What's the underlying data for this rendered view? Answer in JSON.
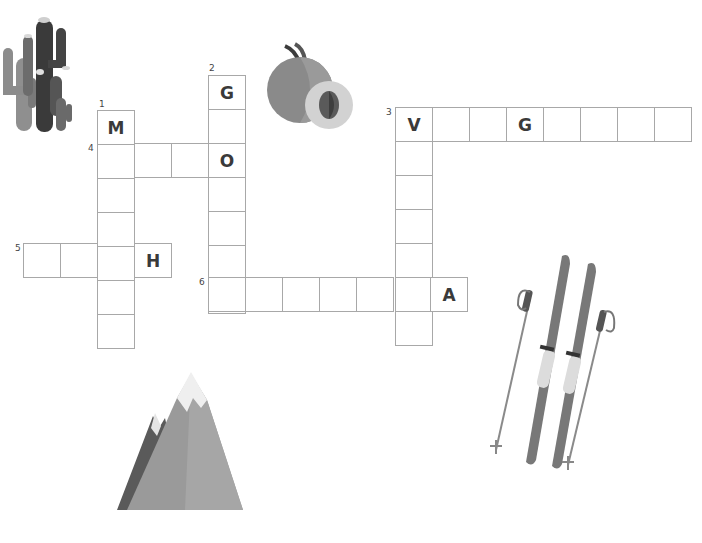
{
  "puzzle": {
    "type": "crossword",
    "cell_size": [
      37,
      34
    ],
    "words": [
      {
        "number": "1",
        "direction": "down",
        "x": 97,
        "y": 110,
        "length": 7,
        "letters": [
          "M",
          "",
          "",
          "",
          "",
          "",
          ""
        ]
      },
      {
        "number": "2",
        "direction": "down",
        "x": 208,
        "y": 75,
        "length": 7,
        "letters": [
          "G",
          "",
          "O",
          "",
          "",
          "",
          ""
        ]
      },
      {
        "number": "3",
        "direction": "across",
        "x": 395,
        "y": 107,
        "length": 8,
        "letters": [
          "V",
          "",
          "",
          "G",
          "",
          "",
          "",
          ""
        ]
      },
      {
        "number": "3",
        "direction": "down",
        "x": 395,
        "y": 107,
        "length": 7,
        "letters": [
          "V",
          "",
          "",
          "",
          "",
          "",
          ""
        ]
      },
      {
        "number": "4",
        "direction": "across",
        "x": 97,
        "y": 143,
        "length": 4,
        "letters": [
          "",
          "",
          "",
          "O"
        ]
      },
      {
        "number": "5",
        "direction": "across",
        "x": 23,
        "y": 243,
        "length": 4,
        "letters": [
          "",
          "",
          "",
          "H"
        ]
      },
      {
        "number": "6",
        "direction": "across",
        "x": 208,
        "y": 277,
        "length": 7,
        "letters": [
          "",
          "",
          "",
          "",
          "",
          "",
          "A"
        ]
      }
    ],
    "clue_numbers": [
      {
        "label": "1",
        "x": 99,
        "y": 99
      },
      {
        "label": "2",
        "x": 209,
        "y": 63
      },
      {
        "label": "3",
        "x": 386,
        "y": 107
      },
      {
        "label": "4",
        "x": 88,
        "y": 143
      },
      {
        "label": "5",
        "x": 15,
        "y": 243
      },
      {
        "label": "6",
        "x": 199,
        "y": 277
      }
    ]
  },
  "illustrations": [
    {
      "name": "cactus",
      "x": 0,
      "y": 8
    },
    {
      "name": "peach",
      "x": 265,
      "y": 42
    },
    {
      "name": "mountain",
      "x": 115,
      "y": 368
    },
    {
      "name": "skis",
      "x": 490,
      "y": 250
    }
  ],
  "colors": {
    "grid_border": "#a8a8a8",
    "letter": "#3a3a3a",
    "background": "#ffffff"
  }
}
